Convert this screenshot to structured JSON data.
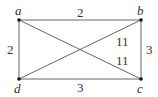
{
  "graph": {
    "vertices": [
      {
        "id": "a",
        "label": "a",
        "x": 19,
        "y": 20
      },
      {
        "id": "b",
        "label": "b",
        "x": 141,
        "y": 20
      },
      {
        "id": "c",
        "label": "c",
        "x": 141,
        "y": 79
      },
      {
        "id": "d",
        "label": "d",
        "x": 19,
        "y": 79
      }
    ],
    "edges": [
      {
        "from": "a",
        "to": "b",
        "weight": "2"
      },
      {
        "from": "a",
        "to": "d",
        "weight": "2"
      },
      {
        "from": "b",
        "to": "c",
        "weight": "3"
      },
      {
        "from": "d",
        "to": "c",
        "weight": "3"
      },
      {
        "from": "d",
        "to": "b",
        "weight": "11"
      },
      {
        "from": "a",
        "to": "c",
        "weight": "11"
      }
    ]
  },
  "labels": {
    "a": "a",
    "b": "b",
    "c": "c",
    "d": "d",
    "w_ab": "2",
    "w_ad": "2",
    "w_bc": "3",
    "w_dc": "3",
    "w_db": "11",
    "w_ac": "11"
  }
}
